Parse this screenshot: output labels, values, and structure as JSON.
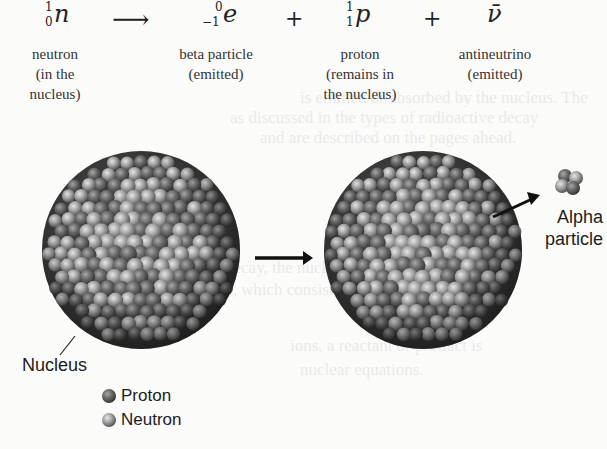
{
  "equation": {
    "reactant": {
      "symbol": "n",
      "mass_number": "1",
      "atomic_number": "0"
    },
    "arrow": "⟶",
    "products": [
      {
        "symbol": "e",
        "mass_number": "0",
        "atomic_number": "−1"
      },
      {
        "symbol": "p",
        "mass_number": "1",
        "atomic_number": "1"
      },
      {
        "symbol": "ν̄",
        "mass_number": "",
        "atomic_number": ""
      }
    ],
    "plus": "+"
  },
  "labels": [
    {
      "lines": [
        "neutron",
        "(in the",
        "nucleus)"
      ]
    },
    {
      "lines": [
        "beta particle",
        "(emitted)"
      ]
    },
    {
      "lines": [
        "proton",
        "(remains in",
        "the nucleus)"
      ]
    },
    {
      "lines": [
        "antineutrino",
        "(emitted)"
      ]
    }
  ],
  "diagram": {
    "nucleus_label": "Nucleus",
    "alpha_label_line1": "Alpha",
    "alpha_label_line2": "particle",
    "legend": [
      {
        "label": "Proton",
        "color": "#5a5a5a"
      },
      {
        "label": "Neutron",
        "color": "#9a9a9a"
      }
    ]
  },
  "background_bleed": [
    "is emitted or absorbed by the nucleus. The",
    "as discussed in the types of radioactive decay",
    "and are described on the pages ahead.",
    "decay, the nucleus emits a particle",
    "y, which consists of two protons and",
    "→ Th +",
    "ions, a reactant or product is",
    "nuclear equations."
  ]
}
